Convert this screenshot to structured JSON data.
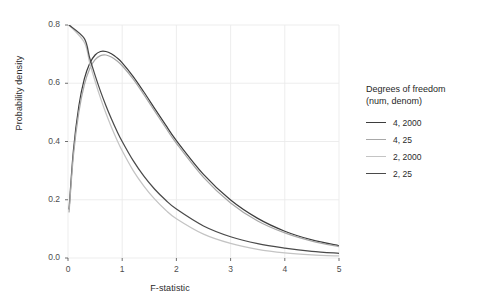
{
  "chart_data": {
    "type": "line",
    "title": "",
    "xlabel": "F-statistic",
    "ylabel": "Probability density",
    "xlim": [
      0,
      5
    ],
    "ylim": [
      0,
      0.8
    ],
    "xticks": [
      0,
      1,
      2,
      3,
      4,
      5
    ],
    "xtick_labels": [
      "0",
      "1",
      "2",
      "3",
      "4",
      "5"
    ],
    "yticks": [
      0.0,
      0.2,
      0.4,
      0.6,
      0.8
    ],
    "ytick_labels": [
      "0.0",
      "0.2",
      "0.4",
      "0.6",
      "0.8"
    ],
    "grid": true,
    "legend_position": "right",
    "legend_title": "Degrees of freedom\n(num, denom)",
    "series": [
      {
        "name": "4, 2000",
        "df1": 4,
        "df2": 2000,
        "color": "#3d3d3d",
        "x": [
          0.02,
          0.1,
          0.2,
          0.3,
          0.4,
          0.5,
          0.6,
          0.7,
          0.8,
          0.9,
          1.0,
          1.2,
          1.4,
          1.6,
          1.8,
          2.0,
          2.5,
          3.0,
          3.5,
          4.0,
          4.5,
          5.0
        ],
        "y": [
          0.168,
          0.369,
          0.522,
          0.614,
          0.668,
          0.697,
          0.709,
          0.709,
          0.701,
          0.688,
          0.67,
          0.624,
          0.57,
          0.513,
          0.457,
          0.403,
          0.287,
          0.199,
          0.136,
          0.092,
          0.062,
          0.042
        ]
      },
      {
        "name": "4, 25",
        "df1": 4,
        "df2": 25,
        "color": "#a8a8a8",
        "x": [
          0.02,
          0.1,
          0.2,
          0.3,
          0.4,
          0.5,
          0.6,
          0.7,
          0.8,
          0.9,
          1.0,
          1.2,
          1.4,
          1.6,
          1.8,
          2.0,
          2.5,
          3.0,
          3.5,
          4.0,
          4.5,
          5.0
        ],
        "y": [
          0.158,
          0.352,
          0.501,
          0.594,
          0.65,
          0.681,
          0.695,
          0.697,
          0.69,
          0.677,
          0.66,
          0.615,
          0.561,
          0.504,
          0.448,
          0.394,
          0.277,
          0.189,
          0.127,
          0.086,
          0.058,
          0.039
        ]
      },
      {
        "name": "2, 2000",
        "df1": 2,
        "df2": 2000,
        "color": "#c4c4c4",
        "x": [
          0.02,
          0.1,
          0.2,
          0.3,
          0.4,
          0.5,
          0.6,
          0.7,
          0.8,
          0.9,
          1.0,
          1.2,
          1.4,
          1.6,
          1.8,
          2.0,
          2.5,
          3.0,
          3.5,
          4.0,
          4.5,
          5.0
        ],
        "y": [
          0.98,
          0.905,
          0.819,
          0.741,
          0.67,
          0.607,
          0.549,
          0.497,
          0.45,
          0.407,
          0.368,
          0.301,
          0.247,
          0.202,
          0.165,
          0.135,
          0.082,
          0.05,
          0.03,
          0.018,
          0.011,
          0.007
        ]
      },
      {
        "name": "2, 25",
        "df1": 2,
        "df2": 25,
        "color": "#4a4a4a",
        "x": [
          0.02,
          0.1,
          0.2,
          0.3,
          0.4,
          0.5,
          0.6,
          0.7,
          0.8,
          0.9,
          1.0,
          1.2,
          1.4,
          1.6,
          1.8,
          2.0,
          2.5,
          3.0,
          3.5,
          4.0,
          4.5,
          5.0
        ],
        "y": [
          0.98,
          0.91,
          0.828,
          0.754,
          0.687,
          0.627,
          0.572,
          0.523,
          0.478,
          0.437,
          0.4,
          0.335,
          0.281,
          0.236,
          0.199,
          0.168,
          0.11,
          0.073,
          0.049,
          0.034,
          0.023,
          0.016
        ]
      }
    ],
    "legend_entries": [
      {
        "label": "4, 2000",
        "color": "#3d3d3d"
      },
      {
        "label": "4, 25",
        "color": "#a8a8a8"
      },
      {
        "label": "2, 2000",
        "color": "#c4c4c4"
      },
      {
        "label": "2, 25",
        "color": "#4a4a4a"
      }
    ],
    "panel": {
      "left": 68,
      "right": 339,
      "top": 25,
      "bottom": 258
    },
    "style": {
      "panel_background": "#ffffff",
      "grid_color": "#ebebeb",
      "tick_color": "#4d4d4d",
      "text_color": "#2b2b2b"
    }
  }
}
